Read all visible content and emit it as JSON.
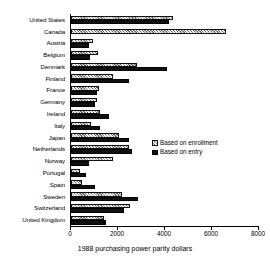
{
  "chart_data": {
    "type": "bar",
    "orientation": "horizontal",
    "title": "",
    "xlabel": "1988 purchasing power parity dollars",
    "ylabel": "",
    "xlim": [
      0,
      8000
    ],
    "xticks": [
      0,
      2000,
      4000,
      6000,
      8000
    ],
    "xticklabels": [
      "0",
      "2000",
      "4000",
      "6000",
      "8000"
    ],
    "grid": false,
    "legend_position": "center-right",
    "categories": [
      "United States",
      "Canada",
      "Austria",
      "Belgium",
      "Denmark",
      "Finland",
      "France",
      "Germany",
      "Ireland",
      "Italy",
      "Japan",
      "Netherlands",
      "Norway",
      "Portugal",
      "Spain",
      "Sweden",
      "Switzerland",
      "United Kingdom"
    ],
    "series": [
      {
        "name": "Based on enrollment",
        "color": "#9a9a9a",
        "pattern": "hatched",
        "values": [
          4350,
          6600,
          930,
          1150,
          2800,
          1800,
          1200,
          1100,
          1250,
          850,
          2050,
          2450,
          1800,
          400,
          450,
          2150,
          2500,
          1400
        ]
      },
      {
        "name": "Based on entry",
        "color": "#101010",
        "pattern": "solid",
        "values": [
          4150,
          0,
          760,
          800,
          4100,
          2450,
          1100,
          1000,
          1600,
          1250,
          2450,
          2600,
          780,
          620,
          1000,
          2850,
          2250,
          1500
        ]
      }
    ],
    "legend": [
      {
        "label": "Based on enrollment",
        "swatch": "hatched"
      },
      {
        "label": "Based on entry",
        "swatch": "solid"
      }
    ]
  }
}
